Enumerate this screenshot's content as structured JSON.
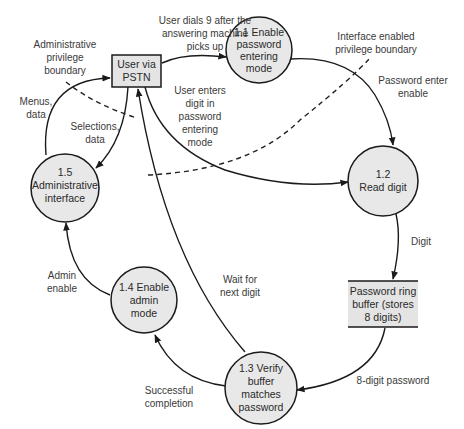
{
  "diagram": {
    "type": "data-flow-diagram",
    "external_entity": {
      "id": "user",
      "lines": [
        "User via",
        "PSTN"
      ]
    },
    "processes": [
      {
        "id": "p1_1",
        "lines": [
          "1.1 Enable",
          "password",
          "entering",
          "mode"
        ]
      },
      {
        "id": "p1_2",
        "lines": [
          "1.2",
          "Read digit"
        ]
      },
      {
        "id": "p1_3",
        "lines": [
          "1.3 Verify",
          "buffer",
          "matches",
          "password"
        ]
      },
      {
        "id": "p1_4",
        "lines": [
          "1.4 Enable",
          "admin",
          "mode"
        ]
      },
      {
        "id": "p1_5",
        "lines": [
          "1.5",
          "Administrative",
          "interface"
        ]
      }
    ],
    "data_store": {
      "id": "ring_buffer",
      "lines": [
        "Password ring",
        "buffer (stores",
        "8 digits)"
      ]
    },
    "flows": [
      {
        "from": "user",
        "to": "p1_1",
        "label_lines": [
          "User dials 9 after the",
          "answering machine",
          "picks up"
        ]
      },
      {
        "from": "user",
        "to": "p1_2",
        "label_lines": [
          "User enters",
          "digit in",
          "password",
          "entering",
          "mode"
        ]
      },
      {
        "from": "p1_1",
        "to": "p1_2",
        "label_lines": [
          "Password enter",
          "enable"
        ]
      },
      {
        "from": "p1_2",
        "to": "ring_buffer",
        "label_lines": [
          "Digit"
        ]
      },
      {
        "from": "ring_buffer",
        "to": "p1_3",
        "label_lines": [
          "8-digit password"
        ]
      },
      {
        "from": "p1_3",
        "to": "p1_4",
        "label_lines": [
          "Successful",
          "completion"
        ]
      },
      {
        "from": "p1_3",
        "to": "user",
        "label_lines": [
          "Wait for",
          "next digit"
        ]
      },
      {
        "from": "p1_4",
        "to": "p1_5",
        "label_lines": [
          "Admin",
          "enable"
        ]
      },
      {
        "from": "p1_5",
        "to": "user",
        "label_lines": [
          "Menus,",
          "data"
        ]
      },
      {
        "from": "user",
        "to": "p1_5",
        "label_lines": [
          "Selections,",
          "data"
        ]
      }
    ],
    "boundaries": [
      {
        "id": "admin_boundary",
        "label_lines": [
          "Administrative",
          "privilege",
          "boundary"
        ]
      },
      {
        "id": "interface_boundary",
        "label_lines": [
          "Interface enabled",
          "privilege boundary"
        ]
      }
    ]
  }
}
